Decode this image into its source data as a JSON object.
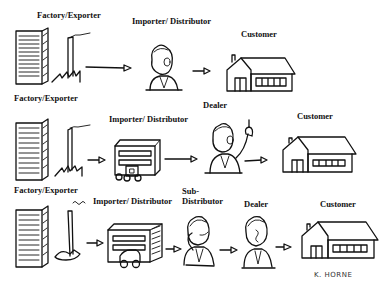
{
  "diagram": {
    "type": "distribution-channel-comparison",
    "rows": [
      {
        "id": "direct-import",
        "nodes": [
          {
            "role": "factory",
            "label": "Factory/Exporter"
          },
          {
            "role": "importer",
            "label": "Importer/ Distributor"
          },
          {
            "role": "customer",
            "label": "Customer"
          }
        ]
      },
      {
        "id": "via-dealer",
        "nodes": [
          {
            "role": "factory",
            "label": "Factory/Exporter"
          },
          {
            "role": "importer",
            "label": "Importer/ Distributor"
          },
          {
            "role": "dealer",
            "label": "Dealer"
          },
          {
            "role": "customer",
            "label": "Customer"
          }
        ]
      },
      {
        "id": "via-sub-distributor",
        "nodes": [
          {
            "role": "factory",
            "label": "Factory/Exporter"
          },
          {
            "role": "importer",
            "label": "Importer/ Distributor"
          },
          {
            "role": "sub-distributor",
            "label_line1": "Sub-",
            "label_line2": "Distributor"
          },
          {
            "role": "dealer",
            "label": "Dealer"
          },
          {
            "role": "customer",
            "label": "Customer"
          }
        ]
      }
    ],
    "signature": "K. HORNE"
  }
}
